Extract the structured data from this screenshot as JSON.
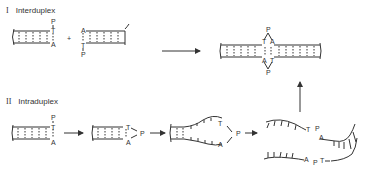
{
  "diagram": {
    "sections": [
      {
        "numeral": "I",
        "label": "Interduplex"
      },
      {
        "numeral": "II",
        "label": "Intraduplex"
      }
    ],
    "bases": {
      "p": "P",
      "t": "T",
      "a": "A"
    },
    "operators": {
      "plus": "+"
    },
    "colors": {
      "stroke": "#333333",
      "background": "#ffffff"
    }
  }
}
